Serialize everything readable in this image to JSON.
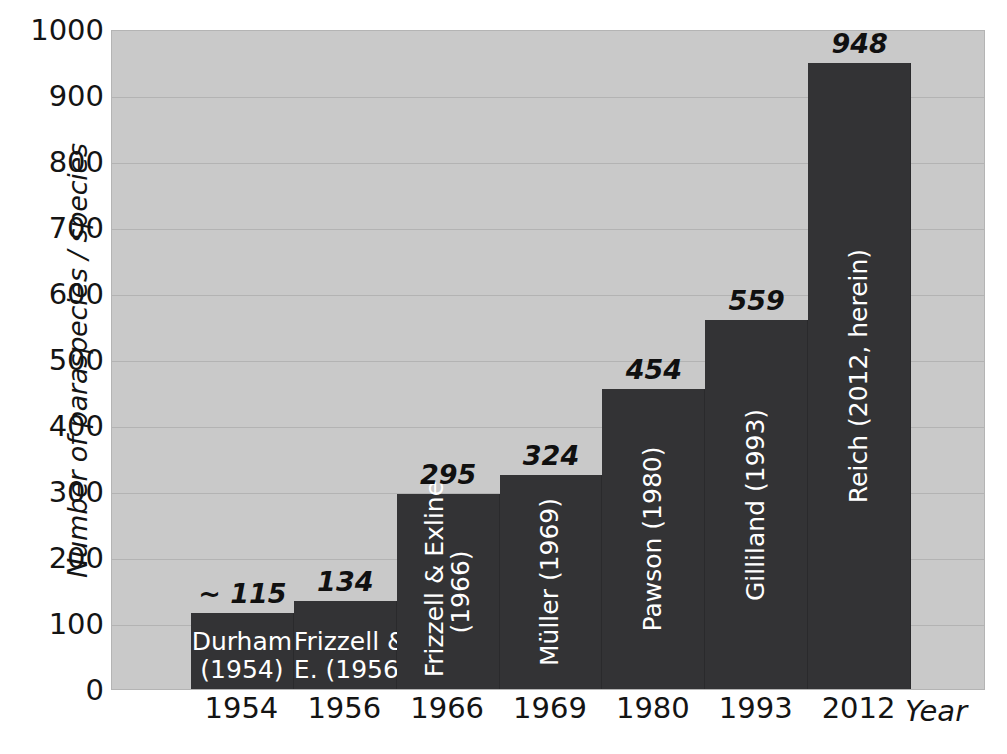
{
  "chart_data": {
    "type": "bar",
    "title": "",
    "xlabel": "Year",
    "ylabel": "Number of paraspecies / species",
    "ylim": [
      0,
      1000
    ],
    "ytick_step": 100,
    "grid": true,
    "legend": "none",
    "categories": [
      "1954",
      "1956",
      "1966",
      "1969",
      "1980",
      "1993",
      "2012"
    ],
    "values": [
      115,
      134,
      295,
      324,
      454,
      559,
      948
    ],
    "value_labels": [
      "~ 115",
      "134",
      "295",
      "324",
      "454",
      "559",
      "948"
    ],
    "bar_labels": [
      "Durham\n(1954)",
      "Frizzell &\nE. (1956)",
      "Frizzell & Exline\n(1966)",
      "Müller (1969)",
      "Pawson (1980)",
      "Gilliland (1993)",
      "Reich (2012, herein)"
    ],
    "bar_label_orientation": [
      "horizontal",
      "horizontal",
      "vertical",
      "vertical",
      "vertical",
      "vertical",
      "vertical"
    ],
    "yticks": [
      "1000",
      "900",
      "800",
      "700",
      "600",
      "500",
      "400",
      "300",
      "200",
      "100",
      "0"
    ]
  },
  "colors": {
    "plot_background": "#c9c9c9",
    "bar_fill": "#333335",
    "bar_label_text": "#ffffff",
    "value_label_text": "#101010",
    "axis_text": "#141414",
    "page_background": "#ffffff",
    "gridline": "#a0a0a0"
  },
  "caption": ""
}
